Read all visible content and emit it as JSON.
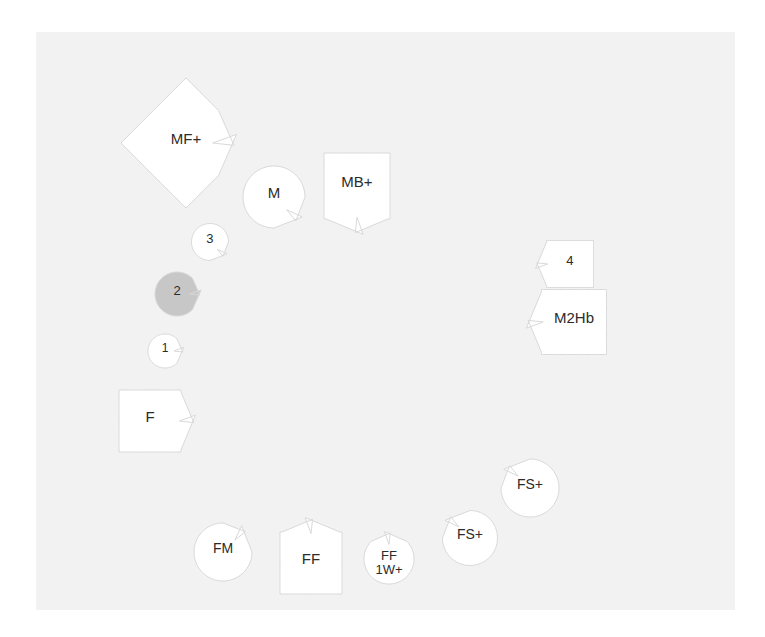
{
  "diagram": {
    "background_color": "#ffffff",
    "panel_color": "#f2f2f2",
    "panel": {
      "x": 36,
      "y": 32,
      "width": 699,
      "height": 578
    },
    "shape_fill_default": "#ffffff",
    "shape_fill_highlight": "#c7c7c7",
    "shape_stroke": "#d9d9d9",
    "text_color": "#2b2b2b",
    "nodes": [
      {
        "id": "mf-plus",
        "label": "MF+",
        "shape": "diamond",
        "fill": "#ffffff",
        "notch": "lower-right",
        "cx": 186,
        "cy": 143,
        "size": 92,
        "font_size": 15
      },
      {
        "id": "m",
        "label": "M",
        "shape": "circle",
        "fill": "#ffffff",
        "notch": "bottom-right",
        "cx": 274,
        "cy": 197,
        "size": 62,
        "font_size": 15
      },
      {
        "id": "mb-plus",
        "label": "MB+",
        "shape": "square",
        "fill": "#ffffff",
        "notch": "bottom",
        "cx": 357,
        "cy": 186,
        "size": 66,
        "font_size": 15
      },
      {
        "id": "three",
        "label": "3",
        "shape": "circle",
        "fill": "#ffffff",
        "notch": "bottom-right",
        "cx": 210,
        "cy": 242,
        "size": 37,
        "font_size": 13
      },
      {
        "id": "two",
        "label": "2",
        "shape": "circle",
        "fill": "#c7c7c7",
        "notch": "right",
        "cx": 177,
        "cy": 294,
        "size": 44,
        "font_size": 13
      },
      {
        "id": "one",
        "label": "1",
        "shape": "circle",
        "fill": "#ffffff",
        "notch": "right",
        "cx": 165,
        "cy": 351,
        "size": 34,
        "font_size": 12
      },
      {
        "id": "f",
        "label": "F",
        "shape": "square",
        "fill": "#ffffff",
        "notch": "right",
        "cx": 150,
        "cy": 421,
        "size": 62,
        "font_size": 15
      },
      {
        "id": "fm",
        "label": "FM",
        "shape": "circle",
        "fill": "#ffffff",
        "notch": "top-right",
        "cx": 223,
        "cy": 552,
        "size": 58,
        "font_size": 14
      },
      {
        "id": "ff",
        "label": "FF",
        "shape": "square",
        "fill": "#ffffff",
        "notch": "top",
        "cx": 311,
        "cy": 563,
        "size": 62,
        "font_size": 15
      },
      {
        "id": "ff-1w-plus",
        "label": "FF\n1W+",
        "shape": "circle",
        "fill": "#ffffff",
        "notch": "top",
        "cx": 389,
        "cy": 559,
        "size": 50,
        "font_size": 13
      },
      {
        "id": "fs-plus-lower",
        "label": "FS+",
        "shape": "circle",
        "fill": "#ffffff",
        "notch": "top-left",
        "cx": 470,
        "cy": 538,
        "size": 55,
        "font_size": 14
      },
      {
        "id": "fs-plus-upper",
        "label": "FS+",
        "shape": "circle",
        "fill": "#ffffff",
        "notch": "top-left",
        "cx": 530,
        "cy": 488,
        "size": 58,
        "font_size": 14
      },
      {
        "id": "m2hb",
        "label": "M2Hb",
        "shape": "square",
        "fill": "#ffffff",
        "notch": "left",
        "cx": 574,
        "cy": 322,
        "size": 65,
        "font_size": 15
      },
      {
        "id": "four",
        "label": "4",
        "shape": "square",
        "fill": "#ffffff",
        "notch": "left",
        "cx": 570,
        "cy": 264,
        "size": 47,
        "font_size": 13
      }
    ]
  }
}
